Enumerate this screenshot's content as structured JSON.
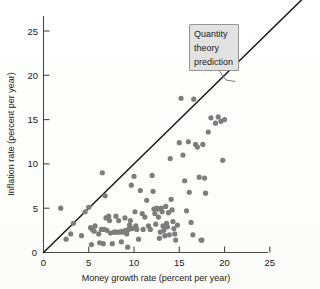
{
  "chart_data": {
    "type": "scatter",
    "title": "",
    "xlabel": "Money growth rate (percent per year)",
    "ylabel": "Inflation rate (percent per year)",
    "xlim": [
      0,
      27.5
    ],
    "ylim": [
      0,
      27.5
    ],
    "xticks": [
      0,
      5,
      10,
      15,
      20,
      25
    ],
    "yticks": [
      0,
      5,
      10,
      15,
      20,
      25
    ],
    "xtick_labels": [
      "0",
      "5",
      "10",
      "15",
      "20",
      "25"
    ],
    "ytick_labels": [
      "0",
      "5",
      "10",
      "15",
      "20",
      "25"
    ],
    "grid": false,
    "legend": "none",
    "annotations": [
      {
        "name": "quantity-theory-prediction",
        "text": "Quantity theory prediction",
        "lines": [
          "Quantity",
          "theory",
          "prediction"
        ],
        "points_to": [
          21.2,
          19.3
        ]
      }
    ],
    "reference_line": {
      "name": "quantity-theory-prediction-line",
      "description": "45-degree line where inflation equals money growth",
      "slope": 1,
      "intercept": 0,
      "x_start": 0,
      "x_end": 28.6,
      "color": "#1b1b1b"
    },
    "series": [
      {
        "name": "countries",
        "marker": "circle",
        "color": "#7d7d7d",
        "points": [
          [
            1.9,
            5.0
          ],
          [
            2.5,
            1.5
          ],
          [
            3.0,
            2.1
          ],
          [
            3.3,
            3.3
          ],
          [
            4.2,
            1.9
          ],
          [
            4.6,
            4.6
          ],
          [
            5.0,
            5.1
          ],
          [
            5.2,
            2.8
          ],
          [
            5.3,
            0.9
          ],
          [
            5.4,
            2.6
          ],
          [
            5.5,
            2.5
          ],
          [
            5.6,
            2.4
          ],
          [
            5.7,
            3.0
          ],
          [
            6.1,
            2.1
          ],
          [
            6.2,
            1.1
          ],
          [
            6.4,
            2.6
          ],
          [
            6.5,
            9.0
          ],
          [
            6.6,
            1.0
          ],
          [
            6.7,
            2.6
          ],
          [
            6.8,
            6.4
          ],
          [
            6.9,
            3.9
          ],
          [
            7.0,
            2.5
          ],
          [
            7.2,
            4.1
          ],
          [
            7.3,
            3.6
          ],
          [
            7.4,
            2.2
          ],
          [
            7.6,
            1.0
          ],
          [
            7.8,
            2.3
          ],
          [
            7.9,
            2.3
          ],
          [
            8.0,
            4.1
          ],
          [
            8.1,
            2.3
          ],
          [
            8.3,
            3.6
          ],
          [
            8.4,
            2.3
          ],
          [
            8.5,
            2.3
          ],
          [
            8.6,
            1.2
          ],
          [
            8.7,
            2.4
          ],
          [
            8.8,
            2.3
          ],
          [
            8.9,
            2.4
          ],
          [
            9.0,
            3.9
          ],
          [
            9.1,
            2.5
          ],
          [
            9.2,
            2.1
          ],
          [
            9.3,
            0.6
          ],
          [
            9.4,
            2.6
          ],
          [
            9.5,
            3.1
          ],
          [
            9.6,
            3.6
          ],
          [
            9.7,
            7.6
          ],
          [
            9.8,
            2.7
          ],
          [
            10.0,
            8.6
          ],
          [
            10.1,
            4.6
          ],
          [
            10.2,
            3.0
          ],
          [
            10.3,
            2.6
          ],
          [
            10.5,
            1.5
          ],
          [
            10.7,
            7.0
          ],
          [
            10.9,
            4.4
          ],
          [
            11.0,
            2.6
          ],
          [
            11.2,
            4.0
          ],
          [
            11.4,
            5.9
          ],
          [
            11.6,
            3.0
          ],
          [
            11.8,
            2.6
          ],
          [
            12.0,
            8.7
          ],
          [
            12.1,
            6.9
          ],
          [
            12.2,
            4.9
          ],
          [
            12.3,
            4.4
          ],
          [
            12.4,
            3.2
          ],
          [
            12.5,
            5.0
          ],
          [
            12.6,
            4.9
          ],
          [
            12.7,
            4.0
          ],
          [
            12.8,
            1.6
          ],
          [
            12.9,
            2.3
          ],
          [
            13.0,
            5.0
          ],
          [
            13.1,
            4.6
          ],
          [
            13.2,
            3.0
          ],
          [
            13.3,
            2.5
          ],
          [
            13.4,
            1.9
          ],
          [
            13.5,
            5.2
          ],
          [
            13.6,
            3.3
          ],
          [
            13.7,
            2.9
          ],
          [
            13.8,
            4.5
          ],
          [
            13.9,
            2.0
          ],
          [
            14.0,
            10.6
          ],
          [
            14.1,
            6.0
          ],
          [
            14.2,
            4.8
          ],
          [
            14.3,
            3.5
          ],
          [
            14.4,
            2.7
          ],
          [
            14.5,
            2.1
          ],
          [
            14.6,
            1.4
          ],
          [
            14.8,
            3.1
          ],
          [
            15.0,
            12.4
          ],
          [
            15.2,
            17.4
          ],
          [
            15.4,
            11.0
          ],
          [
            15.6,
            8.1
          ],
          [
            15.8,
            4.7
          ],
          [
            16.0,
            12.5
          ],
          [
            16.1,
            6.8
          ],
          [
            16.3,
            3.4
          ],
          [
            16.5,
            2.0
          ],
          [
            16.6,
            17.3
          ],
          [
            16.8,
            12.2
          ],
          [
            17.0,
            11.9
          ],
          [
            17.2,
            8.5
          ],
          [
            17.4,
            1.4
          ],
          [
            17.5,
            1.4
          ],
          [
            17.6,
            12.2
          ],
          [
            17.8,
            8.4
          ],
          [
            17.9,
            6.7
          ],
          [
            18.2,
            13.6
          ],
          [
            18.5,
            15.2
          ],
          [
            19.0,
            14.6
          ],
          [
            19.3,
            15.3
          ],
          [
            19.6,
            14.8
          ],
          [
            19.8,
            10.4
          ],
          [
            20.0,
            15.0
          ]
        ]
      }
    ]
  },
  "axes": {
    "x_title": "Money growth rate (percent per year)",
    "y_title": "Inflation rate (percent per year)"
  },
  "callout": {
    "line1": "Quantity",
    "line2": "theory",
    "line3": "prediction"
  },
  "ticks": {
    "x": [
      "0",
      "5",
      "10",
      "15",
      "20",
      "25"
    ],
    "y": [
      "5",
      "10",
      "15",
      "20",
      "25"
    ],
    "y_origin": "0"
  },
  "colors": {
    "dot": "#7d7d7d",
    "line": "#1b1b1b",
    "axis": "#4a4a4a",
    "callout_bg": "#e2e2e2",
    "callout_border": "#8a8a8a"
  }
}
